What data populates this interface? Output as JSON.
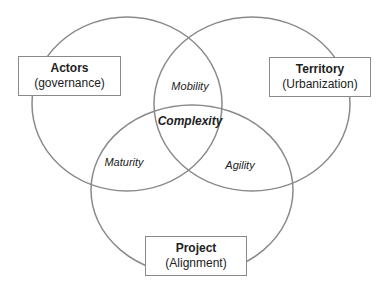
{
  "diagram": {
    "type": "venn",
    "colors": {
      "stroke": "#8a8a8a",
      "text": "#222222",
      "background": "#ffffff"
    },
    "sets": [
      {
        "title": "Actors",
        "subtitle": "(governance)"
      },
      {
        "title": "Territory",
        "subtitle": "(Urbanization)"
      },
      {
        "title": "Project",
        "subtitle": "(Alignment)"
      }
    ],
    "intersections": {
      "actors_territory": "Mobility",
      "actors_project": "Maturity",
      "territory_project": "Agility",
      "center": "Complexity"
    }
  }
}
